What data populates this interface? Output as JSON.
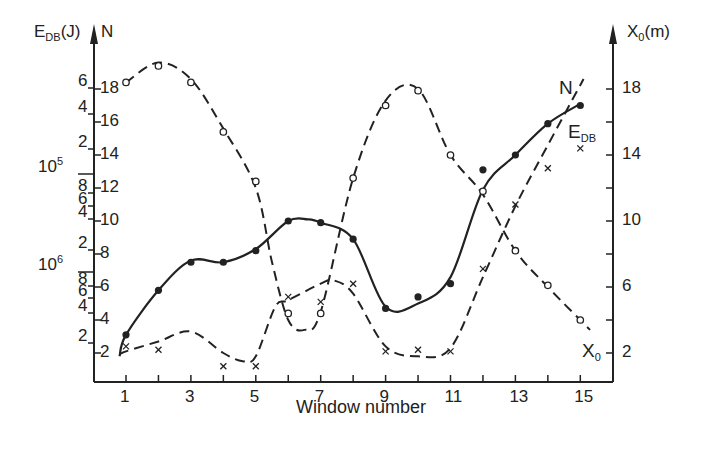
{
  "chart_data": {
    "type": "line",
    "title": "",
    "xlabel": "Window number",
    "x": [
      1,
      2,
      3,
      4,
      5,
      6,
      7,
      8,
      9,
      10,
      11,
      12,
      13,
      14,
      15
    ],
    "x_tick_labels": [
      "1",
      "3",
      "5",
      "7",
      "9",
      "11",
      "13",
      "15"
    ],
    "x_tick_values": [
      1,
      3,
      5,
      7,
      9,
      11,
      13,
      15
    ],
    "left_axis": {
      "label_main": "E",
      "label_sub": "DB",
      "label_unit": "(J)",
      "log_tick_labels": [
        "6",
        "4",
        "2",
        "10^5",
        "8",
        "6",
        "4",
        "2",
        "10^6",
        "8",
        "6",
        "4",
        "2"
      ],
      "second_label": "N",
      "n_tick_labels": [
        "18",
        "16",
        "14",
        "12",
        "10",
        "8",
        "6",
        "4",
        "2"
      ]
    },
    "right_axis": {
      "label_main": "X",
      "label_sub": "0",
      "label_unit": "(m)",
      "tick_labels": [
        "18",
        "14",
        "10",
        "6",
        "2"
      ],
      "ylim": [
        0,
        20
      ]
    },
    "series": [
      {
        "name": "E_DB",
        "label": "E",
        "label_sub": "DB",
        "style": "solid",
        "marker": "filled-circle",
        "axis": "left-log",
        "values_scaled": [
          3.1,
          5.8,
          7.5,
          7.5,
          8.2,
          10.0,
          9.9,
          8.9,
          4.7,
          5.4,
          6.2,
          13.1,
          14.0,
          15.9,
          17.0
        ]
      },
      {
        "name": "N",
        "label": "N",
        "style": "dashed",
        "marker": "cross",
        "axis": "left-N",
        "values": [
          2.4,
          2.2,
          null,
          1.2,
          1.2,
          5.4,
          5.1,
          6.2,
          2.1,
          2.2,
          2.1,
          7.1,
          11.0,
          13.2,
          14.4
        ]
      },
      {
        "name": "X_0",
        "label": "X",
        "label_sub": "0",
        "style": "dashed",
        "marker": "open-circle",
        "axis": "right",
        "values": [
          18.4,
          19.4,
          18.4,
          15.4,
          12.4,
          4.4,
          4.4,
          12.6,
          17.0,
          17.9,
          14.0,
          11.8,
          8.2,
          6.1,
          4.0
        ]
      }
    ],
    "grid": false,
    "legend": "inline curve labels"
  },
  "labels": {
    "xlabel": "Window number",
    "left_title_main": "E",
    "left_title_sub": "DB",
    "left_title_unit": "(J)",
    "left_title_n": "N",
    "right_title_main": "X",
    "right_title_sub": "0",
    "right_title_unit": "(m)",
    "curve_n": "N",
    "curve_edb_main": "E",
    "curve_edb_sub": "DB",
    "curve_x0_main": "X",
    "curve_x0_sub": "0",
    "log_exp_5": "5",
    "log_exp_6": "6",
    "log_base": "10"
  }
}
